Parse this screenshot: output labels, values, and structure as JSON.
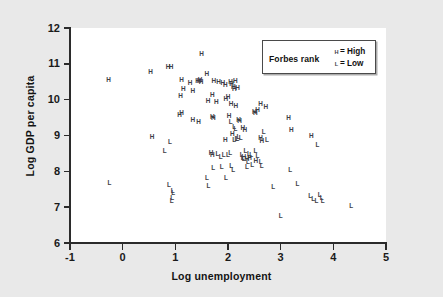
{
  "figure": {
    "background_color": "#e9e9e9",
    "plot_background_color": "#ffffff",
    "axis_color": "#2b2b2b",
    "marker_color": "#3d3d46"
  },
  "legend": {
    "title": "Forbes rank",
    "entries": [
      {
        "marker": "H",
        "separator": "= High",
        "label": "High"
      },
      {
        "marker": "L",
        "separator": "= Low",
        "label": "Low"
      }
    ]
  },
  "chart_data": {
    "type": "scatter",
    "title": "",
    "subtitle": "",
    "xlabel": "Log unemployment",
    "ylabel": "Log GDP per capita",
    "xlim": [
      -1,
      5
    ],
    "ylim": [
      6,
      12
    ],
    "xticks": [
      -1,
      0,
      1,
      2,
      3,
      4,
      5
    ],
    "yticks": [
      6,
      7,
      8,
      9,
      10,
      11,
      12
    ],
    "xtick_labels": [
      "-1",
      "0",
      "1",
      "2",
      "3",
      "4",
      "5"
    ],
    "ytick_labels": [
      "6",
      "7",
      "8",
      "9",
      "10",
      "11",
      "12"
    ],
    "grid": false,
    "legend_position": "top-right",
    "marker_style": "text-glyph",
    "annotations": [],
    "series": [
      {
        "name": "High",
        "marker": "H",
        "points": [
          [
            -0.27,
            10.55
          ],
          [
            0.53,
            10.78
          ],
          [
            0.86,
            10.9
          ],
          [
            0.92,
            10.9
          ],
          [
            1.12,
            10.54
          ],
          [
            1.28,
            10.46
          ],
          [
            1.42,
            10.52
          ],
          [
            1.45,
            10.52
          ],
          [
            1.47,
            10.55
          ],
          [
            1.49,
            10.48
          ],
          [
            1.5,
            11.28
          ],
          [
            1.6,
            10.7
          ],
          [
            1.73,
            10.52
          ],
          [
            1.1,
            10.1
          ],
          [
            1.15,
            10.3
          ],
          [
            1.33,
            10.24
          ],
          [
            1.62,
            9.96
          ],
          [
            1.7,
            10.12
          ],
          [
            1.82,
            10.48
          ],
          [
            1.9,
            10.46
          ],
          [
            1.95,
            10.4
          ],
          [
            2.0,
            10.08
          ],
          [
            2.05,
            10.5
          ],
          [
            2.07,
            10.44
          ],
          [
            2.1,
            10.36
          ],
          [
            2.12,
            10.28
          ],
          [
            2.14,
            10.52
          ],
          [
            1.08,
            9.58
          ],
          [
            1.12,
            9.62
          ],
          [
            1.33,
            9.42
          ],
          [
            1.44,
            9.36
          ],
          [
            1.7,
            9.52
          ],
          [
            1.72,
            9.48
          ],
          [
            1.78,
            9.92
          ],
          [
            2.02,
            9.54
          ],
          [
            2.06,
            9.86
          ],
          [
            2.15,
            9.82
          ],
          [
            2.2,
            9.44
          ],
          [
            2.22,
            9.4
          ],
          [
            2.28,
            9.2
          ],
          [
            2.32,
            9.14
          ],
          [
            2.5,
            9.66
          ],
          [
            2.52,
            9.62
          ],
          [
            2.56,
            9.72
          ],
          [
            2.62,
            9.88
          ],
          [
            2.72,
            9.8
          ],
          [
            1.68,
            8.52
          ],
          [
            1.95,
            8.88
          ],
          [
            2.08,
            9.04
          ],
          [
            2.3,
            8.4
          ],
          [
            2.62,
            8.92
          ],
          [
            2.64,
            8.84
          ],
          [
            0.56,
            8.96
          ],
          [
            3.2,
            9.16
          ],
          [
            3.58,
            8.98
          ],
          [
            1.7,
            8.46
          ],
          [
            2.36,
            8.34
          ],
          [
            2.41,
            8.38
          ],
          [
            2.53,
            8.28
          ],
          [
            3.15,
            9.48
          ],
          [
            1.96,
            10.0
          ],
          [
            2.18,
            10.32
          ]
        ]
      },
      {
        "name": "Low",
        "marker": "L",
        "points": [
          [
            -0.25,
            7.68
          ],
          [
            0.9,
            8.82
          ],
          [
            0.8,
            8.56
          ],
          [
            0.88,
            7.62
          ],
          [
            0.95,
            7.45
          ],
          [
            0.96,
            7.38
          ],
          [
            0.94,
            7.24
          ],
          [
            0.93,
            7.18
          ],
          [
            1.6,
            7.82
          ],
          [
            1.63,
            7.58
          ],
          [
            1.72,
            8.08
          ],
          [
            1.8,
            8.48
          ],
          [
            1.86,
            8.4
          ],
          [
            1.88,
            8.12
          ],
          [
            1.92,
            8.44
          ],
          [
            1.96,
            7.82
          ],
          [
            2.0,
            8.46
          ],
          [
            2.04,
            8.52
          ],
          [
            2.06,
            8.14
          ],
          [
            2.1,
            8.04
          ],
          [
            2.14,
            9.18
          ],
          [
            2.16,
            8.9
          ],
          [
            2.2,
            8.96
          ],
          [
            2.24,
            8.92
          ],
          [
            2.26,
            8.44
          ],
          [
            2.28,
            8.38
          ],
          [
            2.3,
            8.34
          ],
          [
            2.33,
            8.56
          ],
          [
            2.36,
            8.12
          ],
          [
            2.38,
            8.26
          ],
          [
            2.4,
            8.48
          ],
          [
            2.44,
            8.44
          ],
          [
            2.05,
            9.36
          ],
          [
            2.12,
            9.22
          ],
          [
            2.46,
            8.18
          ],
          [
            2.52,
            8.56
          ],
          [
            2.56,
            8.42
          ],
          [
            2.62,
            8.26
          ],
          [
            2.64,
            8.14
          ],
          [
            2.68,
            9.1
          ],
          [
            2.74,
            8.88
          ],
          [
            3.0,
            6.74
          ],
          [
            2.86,
            7.56
          ],
          [
            3.18,
            8.02
          ],
          [
            3.32,
            7.64
          ],
          [
            3.56,
            7.32
          ],
          [
            3.62,
            7.22
          ],
          [
            3.68,
            7.18
          ],
          [
            3.74,
            7.34
          ],
          [
            3.78,
            7.24
          ],
          [
            3.8,
            7.16
          ],
          [
            3.7,
            8.72
          ],
          [
            4.34,
            7.04
          ],
          [
            2.12,
            8.88
          ],
          [
            2.18,
            8.9
          ]
        ]
      }
    ]
  }
}
